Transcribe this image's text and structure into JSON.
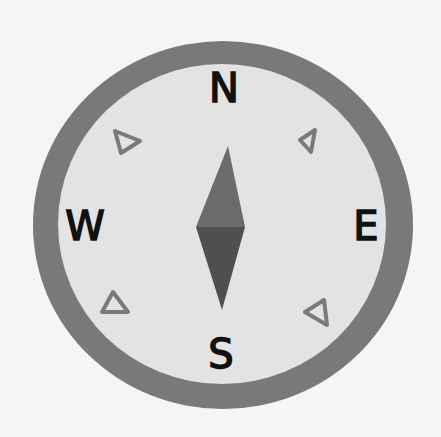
{
  "compass": {
    "directions": {
      "north": "N",
      "east": "E",
      "south": "S",
      "west": "W"
    },
    "intercardinal_markers": [
      "triangle",
      "triangle",
      "triangle",
      "triangle"
    ],
    "colors": {
      "background": "#f5f5f4",
      "ring": "#797979",
      "face": "#e3e3e3",
      "needle_north": "#6b6b6b",
      "needle_south": "#4f4f4f",
      "marker_stroke": "#7a7a7a",
      "letters": "#111111"
    }
  }
}
